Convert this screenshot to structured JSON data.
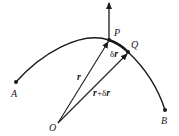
{
  "diagram": {
    "colors": {
      "stroke": "#1a1a1a",
      "background": "#ffffff"
    },
    "points": {
      "A": {
        "label": "A"
      },
      "B": {
        "label": "B"
      },
      "P": {
        "label": "P"
      },
      "Q": {
        "label": "Q"
      },
      "O": {
        "label": "O"
      }
    },
    "vectors": {
      "r": {
        "label": "r"
      },
      "r_plus_dr": {
        "label_r": "r",
        "label_plus": "+",
        "label_delta": "δ",
        "label_r2": "r"
      },
      "dr": {
        "label_delta": "δ",
        "label_r": "r"
      }
    }
  }
}
